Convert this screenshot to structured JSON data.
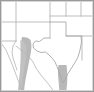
{
  "figure": {
    "kind": "map-thumbnail",
    "title": "",
    "caption": "",
    "width_px": 94,
    "height_px": 92
  },
  "style": {
    "background_color": "#ffffff",
    "frame_color": "#9a9a9a",
    "border_color": "#b9b9b9",
    "state_line_color": "#b5b5b5",
    "coast_line_color": "#a8a8a8",
    "shaded_band_color": "#b4b4b4",
    "shaded_band_color_light": "#c4c4c4"
  },
  "map": {
    "region_name": "southwestern-united-states",
    "projection_hint": "equirectangular",
    "labels_visible": false,
    "graticule_visible": false,
    "legend_visible": false,
    "features": [
      {
        "name": "state-boundaries",
        "type": "lines",
        "color": "#b5b5b5",
        "stroke_width": 0.8,
        "paths": [
          "M 16 1 L 16 41",
          "M 1 22 L 16 22",
          "M 16 22 L 50 22",
          "M 50 1 L 50 38",
          "M 66 1 L 66 16",
          "M 66 16 L 93 16",
          "M 50 16 L 66 16",
          "M 66 16 L 66 36",
          "M 66 36 L 93 36",
          "M 81 1 L 81 16",
          "M 16 41 L 16 46",
          "M 1 41 L 16 41"
        ]
      },
      {
        "name": "texas-outline",
        "type": "polygon-outline",
        "color": "#a8a8a8",
        "stroke_width": 0.9,
        "path": "M 50 22 L 50 38 L 44 38 L 39 42 L 35 41 L 32 44 L 33 48 L 37 51 L 42 53 L 46 52 L 50 55 L 53 58 L 56 62 L 58 67 L 60 72 L 62 78 L 64 82 L 66 79 L 68 74 L 72 68 L 76 62 L 79 56 L 81 48 L 82 40 L 81 34 L 79 28 L 75 24 L 70 22 Z"
      },
      {
        "name": "mexico-border-west",
        "type": "lines",
        "color": "#b5b5b5",
        "stroke_width": 0.8,
        "paths": [
          "M 2 44 L 8 52 L 10 58 L 14 64 L 18 70 L 22 76 L 26 82 L 30 88",
          "M 1 46 L 6 54 L 9 62 L 12 70 L 15 78 L 18 86",
          "M 16 46 L 22 52 L 28 56 L 33 60"
        ]
      },
      {
        "name": "shaded-corridor-west",
        "type": "band",
        "color": "#b4b4b4",
        "path": "M 22 38 L 30 38 L 31 48 L 30 58 L 28 68 L 26 78 L 24 88 L 18 88 L 19 78 L 20 66 L 21 54 Z"
      },
      {
        "name": "shaded-corridor-gulf",
        "type": "band",
        "color": "#b4b4b4",
        "path": "M 58 66 L 66 66 L 67 74 L 67 84 L 66 90 L 59 90 L 58 82 L 57 74 Z"
      }
    ]
  }
}
